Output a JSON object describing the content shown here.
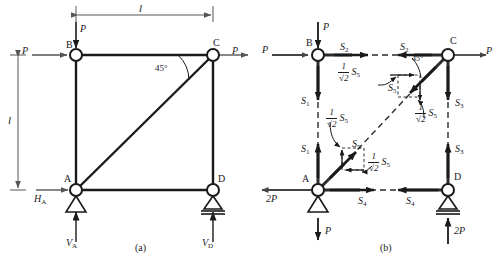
{
  "figure": {
    "caption_a": "(a)",
    "caption_b": "(b)",
    "angle_label": "45°",
    "dimension_h": "l",
    "dimension_v": "l"
  },
  "nodes": {
    "a": "A",
    "b": "B",
    "c": "C",
    "d": "D"
  },
  "panel_a": {
    "loads": {
      "p_top_on_b": "P",
      "p_left_on_b": "P",
      "p_right_on_c": "P"
    },
    "reactions": {
      "h_a": "H",
      "h_a_sub": "A",
      "v_a": "V",
      "v_a_sub": "A",
      "v_d": "V",
      "v_d_sub": "D"
    }
  },
  "panel_b": {
    "external": {
      "p_top_on_b": "P",
      "p_left_on_b": "P",
      "p_right_on_c": "P",
      "two_p_left_at_a": "2P",
      "p_down_at_a": "P",
      "two_p_up_at_d": "2P"
    },
    "members": {
      "s1_upper": "S",
      "s1_lower": "S",
      "s1_sub": "1",
      "s2_left": "S",
      "s2_right": "S",
      "s2_sub": "2",
      "s3_upper": "S",
      "s3_lower": "S",
      "s3_sub": "3",
      "s4_left": "S",
      "s4_right": "S",
      "s4_sub": "4",
      "s5_upper": "S",
      "s5_lower": "S",
      "s5_sub": "5"
    },
    "components": {
      "frac_num": "1",
      "frac_den": "√2",
      "tail": "S",
      "tail_sub": "5",
      "count": 4
    },
    "angle_label": "45°"
  },
  "colors": {
    "stroke": "#1a1a1a",
    "member": "#2b2b2b",
    "background": "#ffffff"
  }
}
